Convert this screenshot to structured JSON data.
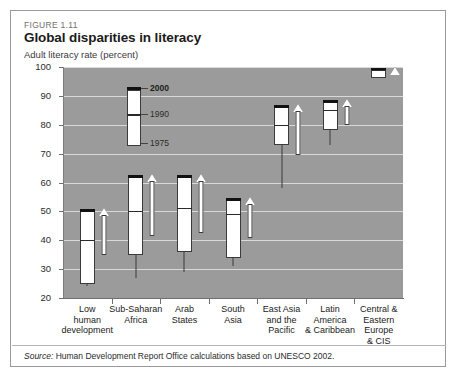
{
  "figure": {
    "number": "FIGURE 1.11",
    "title": "Global disparities in literacy",
    "axis_title": "Adult literacy rate (percent)",
    "source_prefix": "Source:",
    "source_text": " Human Development Report Office calculations based on UNESCO 2002."
  },
  "legend": {
    "top_label": "2000",
    "mid_label": "1990",
    "bottom_label": "1975"
  },
  "colors": {
    "plot_background": "#9b9b9b",
    "gridline": "#d9d9d9",
    "box_fill": "#ffffff",
    "box_outline": "#3b3b3b",
    "cap_2000": "#121212",
    "frame": "#9a9a9a"
  },
  "chart_data": {
    "type": "bar",
    "chart_subtype": "range-candle",
    "title": "Global disparities in literacy",
    "subtitle": "FIGURE 1.11",
    "xlabel": "",
    "ylabel": "Adult literacy rate (percent)",
    "ylim": [
      20,
      100
    ],
    "ytick_values": [
      20,
      30,
      40,
      50,
      60,
      70,
      80,
      90,
      100
    ],
    "ytick_labels": [
      "20",
      "30",
      "40",
      "50",
      "60",
      "70",
      "80",
      "90",
      "100"
    ],
    "grid": true,
    "legend_position": "inside-top-left",
    "series": [
      {
        "name": "1975",
        "values": [
          24,
          27,
          29,
          31,
          58,
          73,
          98
        ]
      },
      {
        "name": "1990",
        "values": [
          40,
          50,
          51,
          49,
          80,
          85,
          99
        ]
      },
      {
        "name": "2000",
        "values": [
          50,
          62,
          62,
          54,
          86,
          88,
          99
        ]
      }
    ],
    "categories": [
      "Low human development",
      "Sub-Saharan Africa",
      "Arab States",
      "South Asia",
      "East Asia and the Pacific",
      "Latin America & Caribbean",
      "Central & Eastern Europe & CIS"
    ],
    "category_label_lines": [
      [
        "Low",
        "human",
        "development"
      ],
      [
        "Sub-Saharan",
        "Africa"
      ],
      [
        "Arab",
        "States"
      ],
      [
        "South",
        "Asia"
      ],
      [
        "East Asia",
        "and the",
        "Pacific"
      ],
      [
        "Latin",
        "America",
        "& Caribbean"
      ],
      [
        "Central &",
        "Eastern",
        "Europe",
        "& CIS"
      ]
    ],
    "annotations": [
      {
        "type": "arrow",
        "direction": "up",
        "category": "Low human development"
      },
      {
        "type": "arrow",
        "direction": "up",
        "category": "Sub-Saharan Africa"
      },
      {
        "type": "arrow",
        "direction": "up",
        "category": "Arab States"
      },
      {
        "type": "arrow",
        "direction": "up",
        "category": "South Asia"
      },
      {
        "type": "arrow",
        "direction": "up",
        "category": "East Asia and the Pacific"
      },
      {
        "type": "arrow",
        "direction": "up",
        "category": "Latin America & Caribbean"
      },
      {
        "type": "arrow",
        "direction": "up",
        "category": "Central & Eastern Europe & CIS"
      }
    ]
  }
}
